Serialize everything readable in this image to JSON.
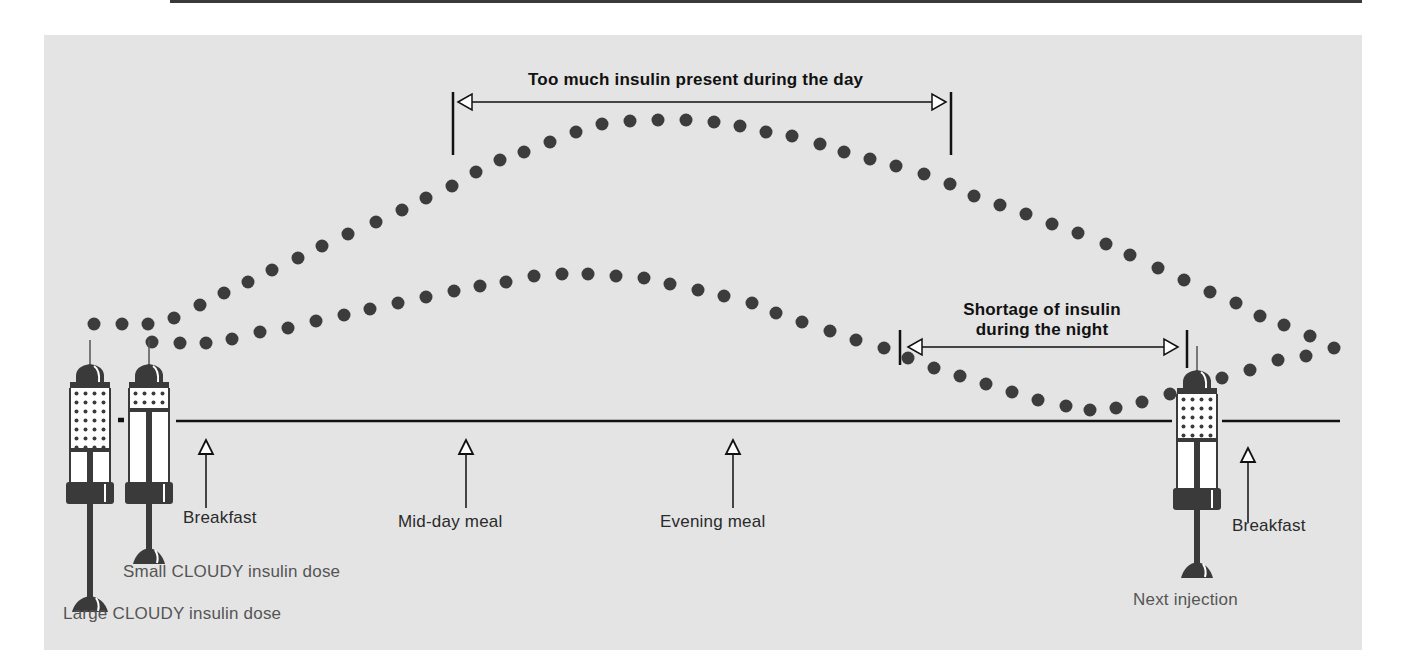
{
  "colors": {
    "background": "#ffffff",
    "panel": "#e4e4e4",
    "dot": "#3c3c3c",
    "line": "#111111",
    "text": "#2a2a2a",
    "caption_text": "#555555"
  },
  "annotations": {
    "day_excess": "Too much insulin present during the day",
    "night_shortage_line1": "Shortage of insulin",
    "night_shortage_line2": "during the night"
  },
  "meals": [
    {
      "label": "Breakfast",
      "x": 206
    },
    {
      "label": "Mid-day meal",
      "x": 466
    },
    {
      "label": "Evening meal",
      "x": 733
    },
    {
      "label": "Breakfast",
      "x": 1248
    }
  ],
  "syringes": [
    {
      "label": "Large CLOUDY insulin dose",
      "type": "large"
    },
    {
      "label": "Small CLOUDY insulin dose",
      "type": "small"
    },
    {
      "label": "Next injection",
      "type": "next"
    }
  ],
  "curves": [
    {
      "name": "Large dose insulin action",
      "description": "Rises after morning injection, peaks mid-day, falls through evening and night",
      "dots": [
        [
          94,
          324
        ],
        [
          122,
          324
        ],
        [
          148,
          324
        ],
        [
          174,
          318
        ],
        [
          200,
          305
        ],
        [
          224,
          293
        ],
        [
          248,
          282
        ],
        [
          272,
          270
        ],
        [
          298,
          258
        ],
        [
          322,
          246
        ],
        [
          348,
          234
        ],
        [
          376,
          222
        ],
        [
          402,
          210
        ],
        [
          426,
          198
        ],
        [
          452,
          186
        ],
        [
          476,
          172
        ],
        [
          500,
          160
        ],
        [
          524,
          152
        ],
        [
          550,
          142
        ],
        [
          576,
          132
        ],
        [
          602,
          124
        ],
        [
          630,
          121
        ],
        [
          658,
          120
        ],
        [
          686,
          120
        ],
        [
          714,
          122
        ],
        [
          740,
          126
        ],
        [
          766,
          132
        ],
        [
          792,
          136
        ],
        [
          820,
          144
        ],
        [
          844,
          152
        ],
        [
          870,
          159
        ],
        [
          896,
          166
        ],
        [
          924,
          174
        ],
        [
          950,
          184
        ],
        [
          974,
          196
        ],
        [
          1000,
          205
        ],
        [
          1026,
          214
        ],
        [
          1052,
          224
        ],
        [
          1078,
          233
        ],
        [
          1106,
          244
        ],
        [
          1130,
          255
        ],
        [
          1158,
          268
        ],
        [
          1184,
          280
        ],
        [
          1210,
          292
        ],
        [
          1236,
          303
        ],
        [
          1260,
          316
        ],
        [
          1284,
          325
        ],
        [
          1310,
          336
        ],
        [
          1334,
          348
        ]
      ]
    },
    {
      "name": "Small dose insulin action",
      "description": "Smaller rise, peaks before evening, falls to lowest point during the night, rises after next injection",
      "dots": [
        [
          152,
          342
        ],
        [
          180,
          343
        ],
        [
          206,
          343
        ],
        [
          232,
          339
        ],
        [
          260,
          332
        ],
        [
          288,
          328
        ],
        [
          316,
          321
        ],
        [
          344,
          315
        ],
        [
          370,
          309
        ],
        [
          398,
          303
        ],
        [
          426,
          297
        ],
        [
          454,
          291
        ],
        [
          480,
          286
        ],
        [
          506,
          282
        ],
        [
          534,
          276
        ],
        [
          562,
          274
        ],
        [
          588,
          274
        ],
        [
          616,
          276
        ],
        [
          644,
          278
        ],
        [
          670,
          284
        ],
        [
          698,
          290
        ],
        [
          724,
          296
        ],
        [
          752,
          303
        ],
        [
          776,
          313
        ],
        [
          802,
          322
        ],
        [
          830,
          331
        ],
        [
          856,
          340
        ],
        [
          884,
          348
        ],
        [
          908,
          358
        ],
        [
          934,
          368
        ],
        [
          960,
          376
        ],
        [
          986,
          384
        ],
        [
          1012,
          392
        ],
        [
          1038,
          400
        ],
        [
          1066,
          406
        ],
        [
          1090,
          410
        ],
        [
          1116,
          408
        ],
        [
          1142,
          402
        ],
        [
          1170,
          394
        ],
        [
          1196,
          386
        ],
        [
          1222,
          378
        ],
        [
          1250,
          370
        ],
        [
          1278,
          360
        ],
        [
          1306,
          356
        ]
      ]
    }
  ],
  "time_axis": {
    "y": 421,
    "x_start": 174,
    "x_end": 1340
  }
}
